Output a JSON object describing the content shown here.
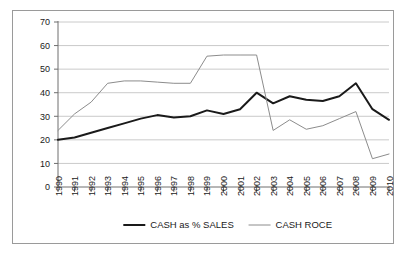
{
  "figure": {
    "background_color": "#ffffff",
    "border_color": "#9a9a9a",
    "grid_color": "#bdbdbd",
    "axis_color": "#6e6e6e"
  },
  "chart_data": {
    "type": "line",
    "title": "",
    "subtitle": "",
    "xlabel": "",
    "ylabel": "",
    "grid": "horizontal",
    "legend_position": "bottom",
    "xlim": [
      1990,
      2010
    ],
    "ylim": [
      0,
      70
    ],
    "ytick_step": 10,
    "yticks": [
      0,
      10,
      20,
      30,
      40,
      50,
      60,
      70
    ],
    "ytick_labels": [
      "0",
      "10",
      "20",
      "30",
      "40",
      "50",
      "60",
      "70"
    ],
    "categories": [
      "1990",
      "1991",
      "1992",
      "1993",
      "1994",
      "1995",
      "1996",
      "1997",
      "1998",
      "1999",
      "2000",
      "2001",
      "2002",
      "2003",
      "2004",
      "2005",
      "2006",
      "2007",
      "2008",
      "2009",
      "2010"
    ],
    "x": [
      1990,
      1991,
      1992,
      1993,
      1994,
      1995,
      1996,
      1997,
      1998,
      1999,
      2000,
      2001,
      2002,
      2003,
      2004,
      2005,
      2006,
      2007,
      2008,
      2009,
      2010
    ],
    "series": [
      {
        "name": "CASH as % SALES",
        "color": "#1a1a1a",
        "width": 2.0,
        "values": [
          20,
          21,
          23,
          25,
          27,
          29,
          30.5,
          29.5,
          30,
          32.5,
          31,
          33,
          40,
          35.5,
          38.5,
          37,
          36.5,
          38.5,
          44,
          33,
          28.5
        ]
      },
      {
        "name": "CASH ROCE",
        "color": "#8c8c8c",
        "width": 1.0,
        "values": [
          24,
          31,
          36,
          44,
          45,
          45,
          44.5,
          44,
          44,
          55.5,
          56,
          56,
          56,
          24,
          28.5,
          24.5,
          26,
          29,
          32,
          12,
          14
        ]
      }
    ],
    "legend": [
      {
        "label": "CASH as % SALES",
        "color": "#1a1a1a",
        "width": 2.0
      },
      {
        "label": "CASH ROCE",
        "color": "#8c8c8c",
        "width": 1.0
      }
    ]
  }
}
